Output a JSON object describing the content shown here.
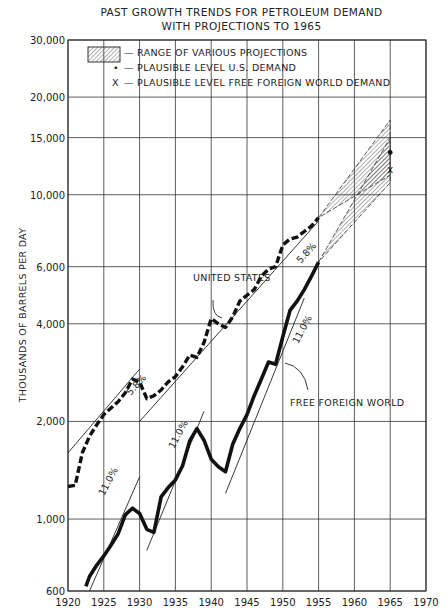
{
  "chart_data": {
    "type": "line",
    "title": "PAST GROWTH TRENDS FOR PETROLEUM DEMAND",
    "subtitle": "WITH PROJECTIONS TO 1965",
    "xlabel": "",
    "ylabel": "THOUSANDS OF BARRELS PER DAY",
    "xlim": [
      1920,
      1970
    ],
    "ylim": [
      600,
      30000
    ],
    "yscale": "log",
    "grid": true,
    "x_ticks": [
      1920,
      1925,
      1930,
      1935,
      1940,
      1945,
      1950,
      1955,
      1960,
      1965,
      1970
    ],
    "x_tick_labels": [
      "1920",
      "1925",
      "1930",
      "1935",
      "1940",
      "1945",
      "1950",
      "1955",
      "1960",
      "1965",
      "1970"
    ],
    "y_ticks": [
      600,
      1000,
      2000,
      4000,
      6000,
      10000,
      15000,
      20000,
      30000
    ],
    "y_tick_labels": [
      "600",
      "1,000",
      "2,000",
      "4,000",
      "6,000",
      "10,000",
      "15,000",
      "20,000",
      "30,000"
    ],
    "legend": [
      {
        "symbol": "hatched-box",
        "label": "— RANGE OF VARIOUS PROJECTIONS"
      },
      {
        "symbol": "•",
        "label": "— PLAUSIBLE LEVEL U.S. DEMAND"
      },
      {
        "symbol": "X",
        "label": "— PLAUSIBLE LEVEL FREE FOREIGN WORLD DEMAND"
      }
    ],
    "legend_position": "upper-left",
    "series": [
      {
        "name": "UNITED STATES",
        "style": "dashed-thick",
        "x": [
          1920,
          1921,
          1922,
          1923,
          1924,
          1925,
          1926,
          1927,
          1928,
          1929,
          1930,
          1931,
          1932,
          1933,
          1934,
          1935,
          1936,
          1937,
          1938,
          1939,
          1940,
          1941,
          1942,
          1943,
          1944,
          1945,
          1946,
          1947,
          1948,
          1949,
          1950,
          1951,
          1952,
          1953,
          1954,
          1955
        ],
        "values": [
          1260,
          1270,
          1600,
          1800,
          1950,
          2100,
          2200,
          2300,
          2450,
          2700,
          2650,
          2350,
          2400,
          2500,
          2650,
          2750,
          2950,
          3200,
          3150,
          3500,
          4150,
          4000,
          3900,
          4200,
          4700,
          4900,
          5100,
          5600,
          5900,
          6000,
          7000,
          7300,
          7400,
          7700,
          8000,
          8500
        ]
      },
      {
        "name": "FREE FOREIGN WORLD",
        "style": "solid-thick",
        "x": [
          1922.5,
          1923,
          1924,
          1925,
          1926,
          1927,
          1928,
          1929,
          1930,
          1931,
          1932,
          1933,
          1934,
          1935,
          1936,
          1937,
          1938,
          1939,
          1940,
          1941,
          1942,
          1943,
          1944,
          1945,
          1946,
          1947,
          1948,
          1949,
          1950,
          1951,
          1952,
          1953,
          1954,
          1955
        ],
        "values": [
          620,
          665,
          720,
          770,
          830,
          900,
          1030,
          1080,
          1040,
          930,
          910,
          1170,
          1250,
          1320,
          1460,
          1740,
          1900,
          1750,
          1530,
          1450,
          1400,
          1700,
          1900,
          2100,
          2400,
          2700,
          3050,
          3000,
          3650,
          4400,
          4700,
          5100,
          5600,
          6200
        ]
      }
    ],
    "trend_lines": [
      {
        "label": "5.8%",
        "series": "UNITED STATES",
        "from": [
          1920,
          1600
        ],
        "to": [
          1930,
          2900
        ]
      },
      {
        "label": "5.8%",
        "series": "UNITED STATES",
        "from": [
          1930,
          2000
        ],
        "to": [
          1955,
          8300
        ]
      },
      {
        "label": "11.0%",
        "series": "FREE FOREIGN WORLD",
        "from": [
          1923,
          600
        ],
        "to": [
          1930,
          1350
        ]
      },
      {
        "label": "11.0%",
        "series": "FREE FOREIGN WORLD",
        "from": [
          1931,
          800
        ],
        "to": [
          1939,
          2150
        ]
      },
      {
        "label": "11.0%",
        "series": "FREE FOREIGN WORLD",
        "from": [
          1942,
          1200
        ],
        "to": [
          1953,
          4800
        ]
      }
    ],
    "projections": [
      {
        "name": "U.S. range",
        "from_year": 1955,
        "from_value": 8500,
        "to_year": 1965,
        "low": 11500,
        "high": 17000,
        "plausible": 13500,
        "marker": "dot"
      },
      {
        "name": "Free Foreign World range",
        "from_year": 1955,
        "from_value": 6200,
        "to_year": 1965,
        "low": 10900,
        "high": 15000,
        "plausible": 12000,
        "marker": "x"
      }
    ],
    "annotations": [
      {
        "text": "UNITED STATES",
        "x": 1943,
        "y": 4900
      },
      {
        "text": "FREE FOREIGN WORLD",
        "x": 1957,
        "y": 2000
      }
    ]
  },
  "labels": {
    "title_line1": "PAST GROWTH TRENDS FOR PETROLEUM DEMAND",
    "title_line2": "WITH PROJECTIONS TO 1965",
    "ylabel": "THOUSANDS OF BARRELS PER DAY",
    "legend_range": "— RANGE OF VARIOUS PROJECTIONS",
    "legend_us_symbol": "•",
    "legend_us": "— PLAUSIBLE LEVEL U.S. DEMAND",
    "legend_ffw_symbol": "X",
    "legend_ffw": "— PLAUSIBLE LEVEL FREE FOREIGN WORLD DEMAND",
    "annot_us": "UNITED STATES",
    "annot_ffw": "FREE FOREIGN WORLD",
    "rate_us": "5.8%",
    "rate_ffw": "11.0%"
  }
}
